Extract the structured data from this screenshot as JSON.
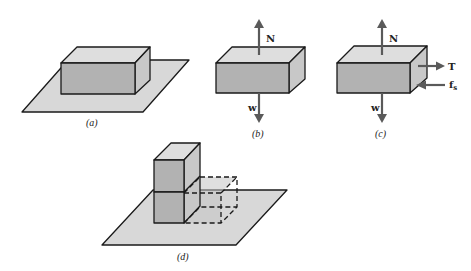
{
  "figure": {
    "panels": [
      {
        "id": "a",
        "caption": "(a)",
        "description": "rectangular block resting on a horizontal surface"
      },
      {
        "id": "b",
        "caption": "(b)",
        "description": "free-body diagram of block with normal and weight forces",
        "forces": {
          "normal": "N",
          "weight": "w"
        }
      },
      {
        "id": "c",
        "caption": "(c)",
        "description": "free-body diagram with tension and static friction",
        "forces": {
          "normal": "N",
          "weight": "w",
          "tension": "T",
          "friction": "f",
          "friction_sub": "s"
        }
      },
      {
        "id": "d",
        "caption": "(d)",
        "description": "two stacked cubes on a surface with a dashed cube outline beside them"
      }
    ]
  },
  "colors": {
    "plane": "#d8d8d8",
    "block_top": "#dedede",
    "block_front": "#b2b2b2",
    "arrow": "#5a5a5a"
  }
}
